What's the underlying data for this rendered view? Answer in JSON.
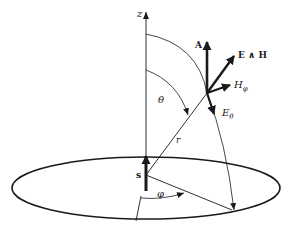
{
  "diagram": {
    "type": "dipole-radiation-geometry",
    "labels": {
      "z_axis": "z",
      "source": "s",
      "radius": "r",
      "theta": "θ",
      "phi": "φ",
      "vector_potential": "A",
      "poynting": "E ∧ H",
      "H_field": "H",
      "H_sub": "φ",
      "E_field": "E",
      "E_sub": "θ"
    },
    "colors": {
      "stroke": "#1a1a1a",
      "background": "#ffffff"
    }
  }
}
